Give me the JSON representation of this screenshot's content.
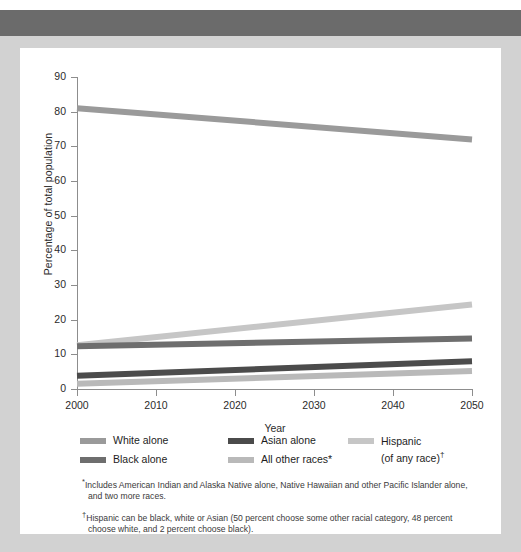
{
  "chart_data": {
    "type": "line",
    "title": "",
    "xlabel": "Year",
    "ylabel": "Percentage of total population",
    "x": [
      2000,
      2050
    ],
    "xlim": [
      2000,
      2050
    ],
    "ylim": [
      0,
      90
    ],
    "xticks": [
      "2000",
      "2010",
      "2020",
      "2030",
      "2040",
      "2050"
    ],
    "yticks": [
      "0",
      "10",
      "20",
      "30",
      "40",
      "50",
      "60",
      "70",
      "80",
      "90"
    ],
    "grid": false,
    "legend_position": "below-plot",
    "series": [
      {
        "name": "White alone",
        "values": [
          81,
          72
        ],
        "color": "#9a9a9a"
      },
      {
        "name": "Black alone",
        "values": [
          12.3,
          14.6
        ],
        "color": "#6e6e6e"
      },
      {
        "name": "Asian alone",
        "values": [
          3.8,
          8.0
        ],
        "color": "#4b4b4b"
      },
      {
        "name": "All other races*",
        "values": [
          1.5,
          5.2
        ],
        "color": "#b9b9b9"
      },
      {
        "name": "Hispanic (of any race)†",
        "values": [
          12.6,
          24.4
        ],
        "color": "#c6c6c6"
      }
    ]
  },
  "axes": {
    "y_title": "Percentage of total population",
    "x_title": "Year",
    "y_ticks": [
      "90",
      "80",
      "70",
      "60",
      "50",
      "40",
      "30",
      "20",
      "10",
      "0"
    ],
    "x_ticks": [
      "2000",
      "2010",
      "2020",
      "2030",
      "2040",
      "2050"
    ]
  },
  "legend": {
    "columns": [
      {
        "items": [
          {
            "label": "White alone",
            "color": "#9a9a9a"
          },
          {
            "label": "Black alone",
            "color": "#6e6e6e"
          }
        ]
      },
      {
        "items": [
          {
            "label": "Asian alone",
            "color": "#4b4b4b"
          },
          {
            "label": "All other races*",
            "color": "#b9b9b9"
          }
        ]
      }
    ],
    "hispanic": {
      "color": "#c6c6c6",
      "line1": "Hispanic",
      "line2": "(of any race)",
      "line2_mark": "†"
    }
  },
  "footnotes": [
    {
      "mark": "*",
      "line1": "Includes American Indian and Alaska Native alone, Native Hawaiian and other Pacific Islander alone,",
      "line2": "and two more races."
    },
    {
      "mark": "†",
      "line1": "Hispanic can be black, white or Asian (50 percent choose some other racial category, 48 percent",
      "line2": "choose white, and 2 percent choose black)."
    }
  ],
  "colors": {
    "page_background": "#d2d2d2",
    "header_bar": "#6b6b6b",
    "card": "#ffffff",
    "axis": "#8d8d8d",
    "text": "#2b2b2b"
  }
}
